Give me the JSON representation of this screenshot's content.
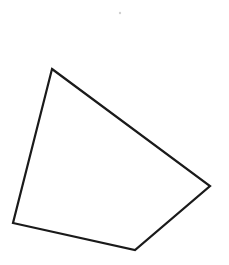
{
  "figure": {
    "width": 229,
    "height": 265,
    "background": "#ffffff",
    "shape": {
      "type": "quadrilateral",
      "vertices": [
        [
          52,
          69
        ],
        [
          210,
          186
        ],
        [
          135,
          250
        ],
        [
          13,
          223
        ]
      ],
      "stroke": "#1a1a1a",
      "stroke_width": 2.2,
      "fill": "none"
    },
    "speck": {
      "x": 120,
      "y": 13,
      "color": "#d0d0d0"
    }
  }
}
